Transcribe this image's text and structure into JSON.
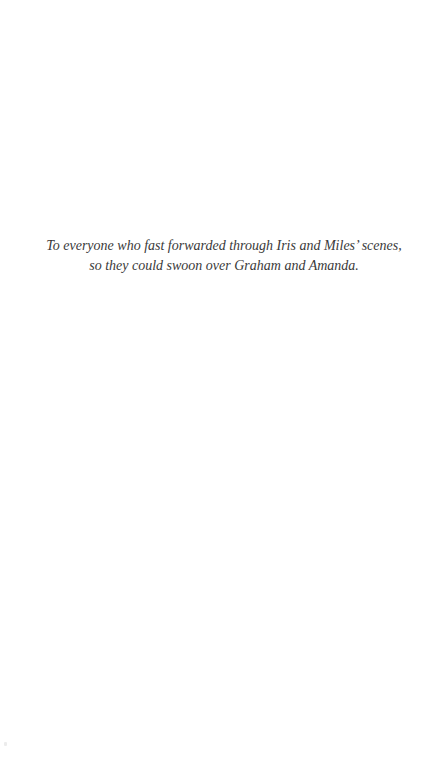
{
  "page": {
    "type": "dedication",
    "background": "#ffffff",
    "text_color": "#3a3a3a"
  },
  "dedication": {
    "lines": [
      "To everyone who fast forwarded through Iris and Miles’ scenes,",
      "so they could swoon over Graham and Amanda."
    ]
  }
}
